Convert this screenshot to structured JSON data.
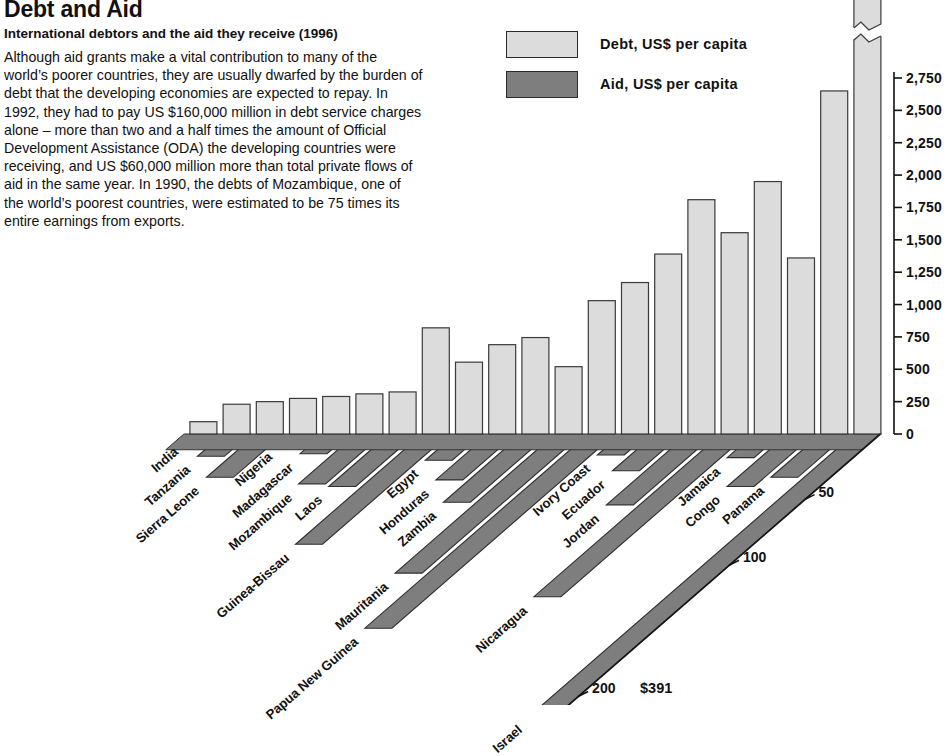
{
  "header": {
    "title": "Debt and Aid",
    "subtitle": "International debtors and the aid they receive (1996)",
    "body": "Although aid grants make a vital contribution to many of the world’s poorer countries, they are usually dwarfed by the burden of debt that the developing economies are expected to repay. In 1992, they had to pay US $160,000 million in debt service charges alone – more than two and a half times the amount of Official Development Assistance (ODA) the developing countries were receiving, and US $60,000 million more than total private flows of aid in the same year. In 1990, the debts of Mozambique, one of the world’s poorest countries, were estimated to be 75 times its entire earnings from exports."
  },
  "legend": {
    "position": "top-center",
    "items": [
      {
        "label": "Debt, US$ per capita",
        "color": "#dcdcdc",
        "swatch_name": "legend-swatch-debt"
      },
      {
        "label": "Aid, US$ per capita",
        "color": "#7e7e7e",
        "swatch_name": "legend-swatch-aid"
      }
    ]
  },
  "annotations": [
    {
      "name": "israel-aid-value",
      "text": "$391",
      "x": 640,
      "y": 680
    }
  ],
  "chart_data": {
    "type": "bar",
    "title": "Debt and Aid",
    "subtitle": "International debtors and the aid they receive (1996)",
    "orientation": "vertical-3d",
    "xlabel": "",
    "ylabel": "Debt, US$ per capita",
    "zlabel": "Aid, US$ per capita",
    "ylim": [
      0,
      2750
    ],
    "zlim": [
      0,
      400
    ],
    "grid": false,
    "ytick_labels": [
      "0",
      "250",
      "500",
      "750",
      "1,000",
      "1,250",
      "1,500",
      "1,750",
      "2,000",
      "2,250",
      "2,500",
      "2,750"
    ],
    "ytick_values": [
      0,
      250,
      500,
      750,
      1000,
      1250,
      1500,
      1750,
      2000,
      2250,
      2500,
      2750
    ],
    "ztick_labels": [
      "50",
      "100",
      "200"
    ],
    "ztick_values": [
      50,
      100,
      200
    ],
    "categories": [
      "India",
      "Tanzania",
      "Sierra Leone",
      "Nigeria",
      "Madagascar",
      "Mozambique",
      "Laos",
      "Guinea-Bissau",
      "Egypt",
      "Honduras",
      "Zambia",
      "Mauritania",
      "Papua New Guinea",
      "Ivory Coast",
      "Ecuador",
      "Jordan",
      "Nicaragua",
      "Jamaica",
      "Congo",
      "Panama",
      "Israel"
    ],
    "series": [
      {
        "name": "Debt, US$ per capita",
        "color": "#dcdcdc",
        "values": [
          95,
          230,
          250,
          275,
          290,
          310,
          325,
          820,
          555,
          690,
          745,
          520,
          1030,
          1170,
          1390,
          1810,
          1555,
          1950,
          1360,
          2650,
          3100
        ]
      },
      {
        "name": "Aid, US$ per capita",
        "color": "#7e7e7e",
        "values": [
          3,
          17,
          33,
          7,
          15,
          38,
          40,
          84,
          20,
          35,
          52,
          106,
          148,
          16,
          28,
          54,
          124,
          18,
          40,
          33,
          391
        ]
      }
    ],
    "notes": [
      "Israel debt bar is drawn broken (off-scale) at the top",
      "Israel aid ribbon is drawn broken and annotated $391"
    ]
  }
}
